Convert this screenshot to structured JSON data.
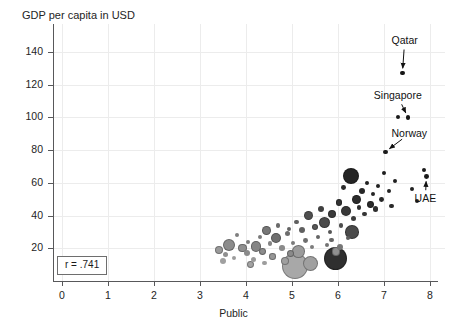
{
  "chart_data": {
    "type": "scatter",
    "title": "GDP per capita in USD",
    "xlabel": "Public",
    "ylabel": "",
    "xlim": [
      0,
      8.4
    ],
    "ylim": [
      0,
      152
    ],
    "x_ticks": [
      0,
      1,
      2,
      3,
      4,
      5,
      6,
      7,
      8
    ],
    "y_ticks": [
      20,
      40,
      60,
      80,
      100,
      120,
      140
    ],
    "grid": true,
    "legend": "none",
    "correlation_label": "r = .741",
    "note": "Bubble scatter; bubble area encodes population, shade encodes income grouping (light grey = lower, dark = higher).",
    "annotations": [
      {
        "label": "Qatar",
        "x": 7.4,
        "y": 127,
        "label_x": 7.45,
        "label_y": 147
      },
      {
        "label": "Singapore",
        "x": 7.52,
        "y": 100,
        "label_x": 7.3,
        "label_y": 113
      },
      {
        "label": "Norway",
        "x": 7.03,
        "y": 79,
        "label_x": 7.55,
        "label_y": 90
      },
      {
        "label": "UAE",
        "x": 7.92,
        "y": 64,
        "label_x": 7.9,
        "label_y": 50
      }
    ],
    "points": [
      {
        "x": 3.42,
        "y": 19,
        "r": 4.0,
        "shade": "#9a9a9a"
      },
      {
        "x": 3.55,
        "y": 16,
        "r": 2.6,
        "shade": "#8f8f8f"
      },
      {
        "x": 3.62,
        "y": 22,
        "r": 6.0,
        "shade": "#8c8c8c"
      },
      {
        "x": 3.74,
        "y": 14,
        "r": 2.4,
        "shade": "#9c9c9c"
      },
      {
        "x": 3.8,
        "y": 28,
        "r": 2.2,
        "shade": "#7f7f7f"
      },
      {
        "x": 3.92,
        "y": 20,
        "r": 4.2,
        "shade": "#909090"
      },
      {
        "x": 4.02,
        "y": 17,
        "r": 3.0,
        "shade": "#8a8a8a"
      },
      {
        "x": 4.05,
        "y": 24,
        "r": 2.0,
        "shade": "#7d7d7d"
      },
      {
        "x": 4.16,
        "y": 13,
        "r": 2.6,
        "shade": "#9a9a9a"
      },
      {
        "x": 4.22,
        "y": 21,
        "r": 5.2,
        "shade": "#858585"
      },
      {
        "x": 4.3,
        "y": 27,
        "r": 2.0,
        "shade": "#7a7a7a"
      },
      {
        "x": 4.36,
        "y": 18,
        "r": 3.4,
        "shade": "#8d8d8d"
      },
      {
        "x": 4.45,
        "y": 31,
        "r": 4.4,
        "shade": "#777777"
      },
      {
        "x": 4.52,
        "y": 23,
        "r": 2.4,
        "shade": "#848484"
      },
      {
        "x": 4.58,
        "y": 15,
        "r": 3.2,
        "shade": "#969696"
      },
      {
        "x": 4.66,
        "y": 26,
        "r": 5.0,
        "shade": "#6f6f6f"
      },
      {
        "x": 4.7,
        "y": 34,
        "r": 2.2,
        "shade": "#6a6a6a"
      },
      {
        "x": 4.78,
        "y": 20,
        "r": 2.8,
        "shade": "#8b8b8b"
      },
      {
        "x": 4.84,
        "y": 12,
        "r": 4.0,
        "shade": "#9f9f9f"
      },
      {
        "x": 4.9,
        "y": 29,
        "r": 2.6,
        "shade": "#6d6d6d"
      },
      {
        "x": 4.96,
        "y": 17,
        "r": 3.6,
        "shade": "#8a8a8a"
      },
      {
        "x": 5.02,
        "y": 23,
        "r": 2.0,
        "shade": "#7b7b7b"
      },
      {
        "x": 5.06,
        "y": 9,
        "r": 13.0,
        "shade": "#a8a8a8"
      },
      {
        "x": 5.1,
        "y": 36,
        "r": 2.2,
        "shade": "#5f5f5f"
      },
      {
        "x": 5.14,
        "y": 18,
        "r": 6.4,
        "shade": "#9b9b9b"
      },
      {
        "x": 5.22,
        "y": 31,
        "r": 3.0,
        "shade": "#606060"
      },
      {
        "x": 5.3,
        "y": 25,
        "r": 2.4,
        "shade": "#6e6e6e"
      },
      {
        "x": 5.36,
        "y": 40,
        "r": 4.6,
        "shade": "#4f4f4f"
      },
      {
        "x": 5.44,
        "y": 21,
        "r": 2.0,
        "shade": "#7c7c7c"
      },
      {
        "x": 5.5,
        "y": 33,
        "r": 3.4,
        "shade": "#585858"
      },
      {
        "x": 5.56,
        "y": 27,
        "r": 2.2,
        "shade": "#656565"
      },
      {
        "x": 5.62,
        "y": 44,
        "r": 3.0,
        "shade": "#3f3f3f"
      },
      {
        "x": 5.7,
        "y": 36,
        "r": 5.6,
        "shade": "#4a4a4a"
      },
      {
        "x": 5.76,
        "y": 22,
        "r": 2.4,
        "shade": "#737373"
      },
      {
        "x": 5.82,
        "y": 30,
        "r": 2.0,
        "shade": "#565656"
      },
      {
        "x": 5.88,
        "y": 41,
        "r": 4.0,
        "shade": "#3a3a3a"
      },
      {
        "x": 5.94,
        "y": 14,
        "r": 11.5,
        "shade": "#2f2f2f"
      },
      {
        "x": 5.96,
        "y": 18,
        "r": 4.2,
        "shade": "#909090"
      },
      {
        "x": 6.02,
        "y": 48,
        "r": 3.2,
        "shade": "#333333"
      },
      {
        "x": 6.06,
        "y": 34,
        "r": 2.2,
        "shade": "#4d4d4d"
      },
      {
        "x": 6.12,
        "y": 57,
        "r": 2.4,
        "shade": "#2a2a2a"
      },
      {
        "x": 6.18,
        "y": 43,
        "r": 5.0,
        "shade": "#383838"
      },
      {
        "x": 6.22,
        "y": 26,
        "r": 2.0,
        "shade": "#5d5d5d"
      },
      {
        "x": 6.28,
        "y": 64,
        "r": 8.0,
        "shade": "#242424"
      },
      {
        "x": 6.34,
        "y": 38,
        "r": 2.6,
        "shade": "#3c3c3c"
      },
      {
        "x": 6.4,
        "y": 50,
        "r": 4.4,
        "shade": "#2c2c2c"
      },
      {
        "x": 6.46,
        "y": 45,
        "r": 2.2,
        "shade": "#303030"
      },
      {
        "x": 6.52,
        "y": 55,
        "r": 3.0,
        "shade": "#272727"
      },
      {
        "x": 6.58,
        "y": 41,
        "r": 2.4,
        "shade": "#343434"
      },
      {
        "x": 6.64,
        "y": 60,
        "r": 2.0,
        "shade": "#222222"
      },
      {
        "x": 6.7,
        "y": 47,
        "r": 3.4,
        "shade": "#2b2b2b"
      },
      {
        "x": 6.76,
        "y": 53,
        "r": 2.2,
        "shade": "#252525"
      },
      {
        "x": 6.82,
        "y": 44,
        "r": 2.6,
        "shade": "#2e2e2e"
      },
      {
        "x": 6.88,
        "y": 58,
        "r": 2.0,
        "shade": "#212121"
      },
      {
        "x": 6.94,
        "y": 50,
        "r": 2.4,
        "shade": "#262626"
      },
      {
        "x": 7.0,
        "y": 66,
        "r": 2.2,
        "shade": "#1e1e1e"
      },
      {
        "x": 7.03,
        "y": 79,
        "r": 2.2,
        "shade": "#1a1a1a"
      },
      {
        "x": 7.1,
        "y": 55,
        "r": 2.0,
        "shade": "#232323"
      },
      {
        "x": 7.16,
        "y": 46,
        "r": 2.2,
        "shade": "#2a2a2a"
      },
      {
        "x": 7.24,
        "y": 61,
        "r": 2.0,
        "shade": "#1f1f1f"
      },
      {
        "x": 7.3,
        "y": 100,
        "r": 2.0,
        "shade": "#1a1a1a"
      },
      {
        "x": 7.4,
        "y": 127,
        "r": 2.2,
        "shade": "#161616"
      },
      {
        "x": 7.52,
        "y": 100,
        "r": 2.2,
        "shade": "#181818"
      },
      {
        "x": 7.6,
        "y": 56,
        "r": 2.0,
        "shade": "#222222"
      },
      {
        "x": 7.72,
        "y": 49,
        "r": 2.2,
        "shade": "#262626"
      },
      {
        "x": 7.86,
        "y": 68,
        "r": 2.0,
        "shade": "#1c1c1c"
      },
      {
        "x": 7.92,
        "y": 64,
        "r": 2.4,
        "shade": "#1a1a1a"
      },
      {
        "x": 6.3,
        "y": 30,
        "r": 6.8,
        "shade": "#4a4a4a"
      },
      {
        "x": 5.4,
        "y": 11,
        "r": 7.5,
        "shade": "#a0a0a0"
      },
      {
        "x": 4.1,
        "y": 10,
        "r": 3.4,
        "shade": "#a3a3a3"
      },
      {
        "x": 3.5,
        "y": 12,
        "r": 3.0,
        "shade": "#a0a0a0"
      },
      {
        "x": 6.05,
        "y": 21,
        "r": 3.0,
        "shade": "#777777"
      },
      {
        "x": 5.86,
        "y": 25,
        "r": 2.2,
        "shade": "#666666"
      },
      {
        "x": 4.94,
        "y": 32,
        "r": 2.0,
        "shade": "#636363"
      },
      {
        "x": 4.4,
        "y": 11,
        "r": 2.2,
        "shade": "#9d9d9d"
      }
    ]
  }
}
